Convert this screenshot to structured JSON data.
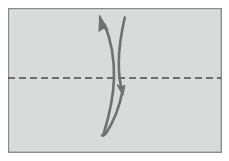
{
  "diagram": {
    "type": "paper-folding-instruction",
    "canvas": {
      "width": 229,
      "height": 161,
      "background": "#ffffff"
    },
    "paper": {
      "label": "paper-sheet",
      "shape": "rectangle",
      "x": 8,
      "y": 8,
      "width": 214,
      "height": 145,
      "fill": "#d9dada",
      "stroke": "#8b8d8d",
      "stroke_width": 1.4
    },
    "fold_line": {
      "label": "horizontal fold crease",
      "style": "dashed",
      "y": 78,
      "x_start": 8,
      "x_end": 221,
      "color": "#4a4a4a",
      "stroke_width": 1.6,
      "dash": "7 4"
    },
    "arrows": [
      {
        "label": "fold-up-arrow",
        "direction": "up-left",
        "color": "#6f7070",
        "stroke_width": 2.6,
        "tip": {
          "x": 100,
          "y": 16
        },
        "tail": {
          "x": 103,
          "y": 134
        },
        "head_style": "solid-triangle"
      },
      {
        "label": "unfold-down-arrow",
        "direction": "down",
        "color": "#6f7070",
        "stroke_width": 2.6,
        "tip": {
          "x": 122,
          "y": 94
        },
        "tail": {
          "x": 125,
          "y": 17
        },
        "head_style": "solid-triangle"
      }
    ],
    "caption": ""
  }
}
